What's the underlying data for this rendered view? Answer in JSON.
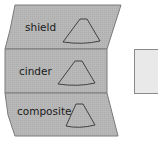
{
  "diagram": {
    "segments": [
      {
        "label": "shield",
        "icon": "fan-sector-icon"
      },
      {
        "label": "cinder",
        "icon": "fan-sector-icon"
      },
      {
        "label": "composite",
        "icon": "fan-sector-icon"
      }
    ],
    "colors": {
      "fill": "#b5b5b5",
      "stroke": "#6e6e6e",
      "side_box": "#e9e9e9"
    }
  }
}
